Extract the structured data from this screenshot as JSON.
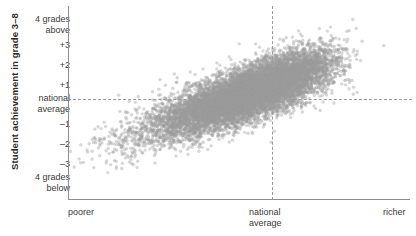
{
  "chart_data": {
    "type": "scatter",
    "title": "",
    "subtitle": "",
    "ylabel": "Student achievement in grade 3–8",
    "xlabel": "",
    "grid": false,
    "legend": null,
    "xlim": [
      -4,
      4
    ],
    "ylim": [
      -4,
      4
    ],
    "x_ticks": [
      {
        "value": -4,
        "label": "poorer"
      },
      {
        "value": 0,
        "label": "national\naverage"
      },
      {
        "value": 4,
        "label": "richer"
      }
    ],
    "x_tick_labels": [
      "poorer",
      "national average",
      "richer"
    ],
    "y_ticks": [
      {
        "value": 4,
        "label": "4 grades above"
      },
      {
        "value": 3,
        "label": "+3"
      },
      {
        "value": 2,
        "label": "+2"
      },
      {
        "value": 1,
        "label": "+1"
      },
      {
        "value": 0,
        "label": "national average"
      },
      {
        "value": -1,
        "label": "–1"
      },
      {
        "value": -2,
        "label": "–2"
      },
      {
        "value": -3,
        "label": "–3"
      },
      {
        "value": -4,
        "label": "4 grades below"
      }
    ],
    "y_tick_labels": [
      "4 grades above",
      "+3",
      "+2",
      "+1",
      "national average",
      "–1",
      "–2",
      "–3",
      "4 grades below"
    ],
    "reference_lines": [
      {
        "orientation": "horizontal",
        "value": 0,
        "label": "national average",
        "style": "dashed"
      },
      {
        "orientation": "vertical",
        "value": 0,
        "label": "national average",
        "style": "dashed"
      }
    ],
    "point_color": "#9b9b9b",
    "point_opacity": 0.4,
    "point_radius_px": 1.7,
    "n_points": 11000,
    "correlation": 0.74,
    "regression": {
      "slope": 0.78,
      "intercept": 0.15
    },
    "cloud": {
      "x_mean": 0.15,
      "x_sd": 1.05,
      "y_mean": 0.1,
      "y_sd": 1.0,
      "x_skew": -0.25
    }
  },
  "axis": {
    "y_title": "Student achievement in grade 3–8",
    "y_ticks": [
      {
        "line1": "4 grades",
        "line2": "above",
        "y": 14
      },
      {
        "line1": "+3",
        "line2": "",
        "y": 40
      },
      {
        "line1": "+2",
        "line2": "",
        "y": 60
      },
      {
        "line1": "+1",
        "line2": "",
        "y": 80
      },
      {
        "line1": "national",
        "line2": "average",
        "y": 93
      },
      {
        "line1": "–1",
        "line2": "",
        "y": 119
      },
      {
        "line1": "–2",
        "line2": "",
        "y": 139
      },
      {
        "line1": "–3",
        "line2": "",
        "y": 159
      },
      {
        "line1": "4 grades",
        "line2": "below",
        "y": 172
      }
    ],
    "x_ticks": [
      {
        "line1": "poorer",
        "line2": "",
        "x": 68,
        "align": "left"
      },
      {
        "line1": "national",
        "line2": "average",
        "x": 249,
        "align": "left"
      },
      {
        "line1": "richer",
        "line2": "",
        "x": 383,
        "align": "left"
      }
    ]
  },
  "colors": {
    "axis_line": "#8d8d8d",
    "reference_line": "#9a9a9a",
    "tick_text": "#3a3a3a",
    "title_text": "#2b2b2b",
    "point": "#9b9b9b",
    "background": "#ffffff"
  }
}
